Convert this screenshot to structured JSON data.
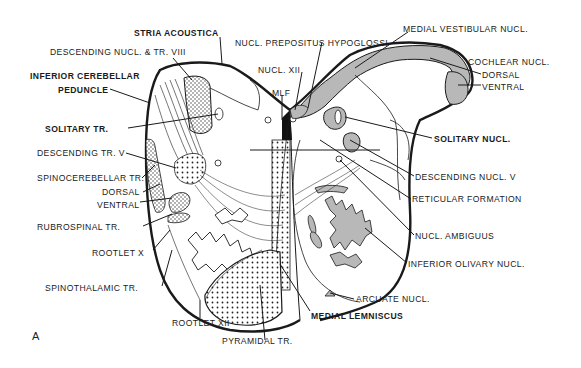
{
  "figure": {
    "panel_letter": "A"
  },
  "colors": {
    "line": "#1a1a1a",
    "gray_fill": "#b8b8b8",
    "background": "#ffffff",
    "black_fill": "#111111"
  },
  "labels": {
    "stria_acoustica": "STRIA ACOUSTICA",
    "descending_nucl_tr_viii": "DESCENDING NUCL. & TR. VIII",
    "inferior_cerebellar": "INFERIOR CEREBELLAR",
    "peduncle": "PEDUNCLE",
    "solitary_tr": "SOLITARY TR.",
    "descending_tr_v": "DESCENDING TR. V",
    "spinocerebellar_tr": "SPINOCEREBELLAR TR.",
    "dorsal_left": "DORSAL",
    "ventral_left": "VENTRAL",
    "rubrospinal_tr": "RUBROSPINAL TR.",
    "rootlet_x": "ROOTLET X",
    "spinothalamic_tr": "SPINOTHALAMIC TR.",
    "rootlet_xii": "ROOTLET XII",
    "pyramidal_tr": "PYRAMIDAL TR.",
    "medial_lemniscus": "MEDIAL LEMNISCUS",
    "arcuate_nucl": "ARCUATE NUCL.",
    "inferior_olivary_nucl": "INFERIOR OLIVARY NUCL.",
    "nucl_ambiguus": "NUCL. AMBIGUUS",
    "reticular_formation": "RETICULAR FORMATION",
    "descending_nucl_v": "DESCENDING NUCL. V",
    "solitary_nucl": "SOLITARY NUCL.",
    "cochlear_nucl": "COCHLEAR NUCL.",
    "dorsal_right": "DORSAL",
    "ventral_right": "VENTRAL",
    "medial_vestibular_nucl": "MEDIAL VESTIBULAR NUCL.",
    "nucl_prepositus_hypoglossi": "NUCL. PREPOSITUS HYPOGLOSSI",
    "nucl_xii": "NUCL. XII",
    "mlf": "MLF"
  }
}
